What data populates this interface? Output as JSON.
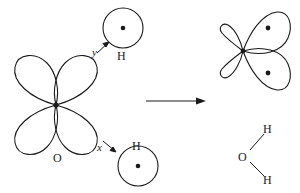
{
  "figure": {
    "type": "orbital-hybridization-diagram",
    "stroke_color": "#1a1a1a",
    "background_color": "#ffffff"
  },
  "reactants": {
    "oxygen": {
      "label": "O",
      "label_x": 53,
      "label_y": 152,
      "center_x": 56,
      "center_y": 105,
      "lobe_count": 4
    },
    "hydrogen_top": {
      "label": "H",
      "label_x": 117,
      "label_y": 50,
      "circle_cx": 123,
      "circle_cy": 28,
      "circle_r": 20,
      "electron_dot": true
    },
    "hydrogen_bottom": {
      "label": "H",
      "label_x": 132,
      "label_y": 140,
      "circle_cx": 138,
      "circle_cy": 166,
      "circle_r": 20,
      "electron_dot": true
    },
    "axis_labels": [
      {
        "text": "y",
        "x": 92,
        "y": 47
      },
      {
        "text": "x",
        "x": 97,
        "y": 142
      }
    ]
  },
  "arrow": {
    "name": "reaction-arrow",
    "x_start": 146,
    "x_end": 205,
    "y": 101
  },
  "products": {
    "hybrid_orbital": {
      "center_x": 243,
      "center_y": 51,
      "large_lobe_dots": [
        {
          "cx": 268,
          "cy": 28
        },
        {
          "cx": 268,
          "cy": 73
        }
      ],
      "small_lobe_count": 2,
      "large_lobe_count": 2
    },
    "water_molecule": {
      "oxygen_label": "O",
      "oxygen_x": 238,
      "oxygen_y": 151,
      "hydrogen_top_label": "H",
      "hydrogen_top_x": 263,
      "hydrogen_top_y": 123,
      "hydrogen_bottom_label": "H",
      "hydrogen_bottom_x": 263,
      "hydrogen_bottom_y": 174
    }
  }
}
